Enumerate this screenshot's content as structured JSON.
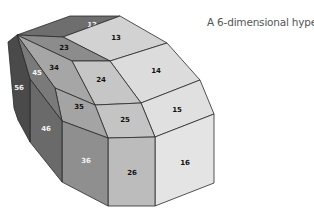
{
  "title": "A 6-dimensional hyperbox",
  "colors": {
    "face_12": "#6e6e6e",
    "face_13": "#d2d2d2",
    "face_23": "#8c8c8c",
    "face_14": "#dcdcdc",
    "face_24": "#c6c6c6",
    "face_34": "#a6a6a6",
    "face_15": "#e0e0e0",
    "face_25": "#c4c4c4",
    "face_35": "#a4a4a4",
    "face_16": "#e4e4e4",
    "face_26": "#bcbcbc",
    "face_36": "#8f8f8f",
    "face_45": "#7a7a7a",
    "face_46": "#6a6a6a",
    "face_56": "#4a4a4a",
    "edge": "#2a2a2a",
    "label_dark": "#111111",
    "label_light": "#f2f2f2"
  },
  "faces": [
    {
      "label": "12",
      "points": "17,35 70,16 120,16 63,37",
      "lx": 92,
      "ly": 25,
      "fill": "#6e6e6e",
      "text": "light"
    },
    {
      "label": "13",
      "points": "63,37 120,16 167,43 110,61",
      "lx": 116,
      "ly": 38,
      "fill": "#d2d2d2",
      "text": "dark"
    },
    {
      "label": "23",
      "points": "17,35 63,37 110,61 72,61",
      "lx": 64,
      "ly": 48,
      "fill": "#8c8c8c",
      "text": "dark"
    },
    {
      "label": "14",
      "points": "110,61 167,43 200,80 141,103",
      "lx": 156,
      "ly": 71,
      "fill": "#dcdcdc",
      "text": "dark"
    },
    {
      "label": "24",
      "points": "72,61 110,61 141,103 95,105",
      "lx": 101,
      "ly": 80,
      "fill": "#c6c6c6",
      "text": "dark"
    },
    {
      "label": "34",
      "points": "17,35 72,61 95,105 55,88",
      "lx": 54,
      "ly": 68,
      "fill": "#a6a6a6",
      "text": "dark"
    },
    {
      "label": "15",
      "points": "141,103 200,80 214,114 155,137",
      "lx": 177,
      "ly": 110,
      "fill": "#e0e0e0",
      "text": "dark"
    },
    {
      "label": "25",
      "points": "95,105 141,103 155,137 108,138",
      "lx": 125,
      "ly": 120,
      "fill": "#c4c4c4",
      "text": "dark"
    },
    {
      "label": "35",
      "points": "55,88 95,105 108,138 62,121",
      "lx": 79,
      "ly": 107,
      "fill": "#a4a4a4",
      "text": "dark"
    },
    {
      "label": "16",
      "points": "155,137 214,114 214,183 155,206",
      "lx": 185,
      "ly": 163,
      "fill": "#e4e4e4",
      "text": "dark"
    },
    {
      "label": "26",
      "points": "108,138 155,137 155,206 108,206",
      "lx": 132,
      "ly": 173,
      "fill": "#bcbcbc",
      "text": "dark"
    },
    {
      "label": "36",
      "points": "62,121 108,138 108,206 62,182",
      "lx": 86,
      "ly": 161,
      "fill": "#8f8f8f",
      "text": "light"
    },
    {
      "label": "45",
      "points": "17,35 55,88 62,121 30,79",
      "lx": 37,
      "ly": 73,
      "fill": "#7a7a7a",
      "text": "light"
    },
    {
      "label": "46",
      "points": "30,79 62,121 62,182 30,142",
      "lx": 46,
      "ly": 129,
      "fill": "#6a6a6a",
      "text": "light"
    },
    {
      "label": "56",
      "points": "17,35 30,79 30,142 18,120 14,108 8,42",
      "lx": 19,
      "ly": 88,
      "fill": "#4a4a4a",
      "text": "light"
    }
  ]
}
